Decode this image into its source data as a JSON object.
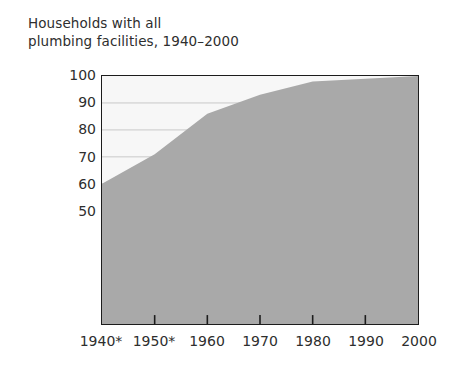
{
  "chart_data": {
    "type": "area",
    "title": "Households with all\nplumbing facilities, 1940–2000",
    "xlabel": "",
    "ylabel": "Percentage",
    "categories": [
      "1940*",
      "1950*",
      "1960",
      "1970",
      "1980",
      "1990",
      "2000"
    ],
    "x": [
      1940,
      1950,
      1960,
      1970,
      1980,
      1990,
      2000
    ],
    "values": [
      60,
      71,
      86,
      93,
      98,
      99,
      100
    ],
    "series": [
      {
        "name": "Households with all plumbing facilities",
        "values": [
          60,
          71,
          86,
          93,
          98,
          99,
          100
        ]
      }
    ],
    "ylim": [
      8,
      100
    ],
    "xlim": [
      1940,
      2000
    ],
    "y_ticks": [
      100,
      90,
      80,
      70,
      60,
      50
    ],
    "grid": true,
    "grid_axis": "y",
    "legend": "none",
    "fill_color": "#a9a9a9",
    "plot_background": "#f7f7f7",
    "grid_color": "#c9c9c9",
    "axis_color": "#1c1c1c",
    "text_color": "#2e2e2e",
    "footnote_marker": "*"
  },
  "axes": {
    "y": {
      "title": "Percentage",
      "ticks": [
        {
          "label": "100",
          "value": 100
        },
        {
          "label": "90",
          "value": 90
        },
        {
          "label": "80",
          "value": 80
        },
        {
          "label": "70",
          "value": 70
        },
        {
          "label": "60",
          "value": 60
        },
        {
          "label": "50",
          "value": 50
        }
      ]
    },
    "x": {
      "title": "",
      "ticks": [
        {
          "label": "1940*",
          "value": 1940
        },
        {
          "label": "1950*",
          "value": 1950
        },
        {
          "label": "1960",
          "value": 1960
        },
        {
          "label": "1970",
          "value": 1970
        },
        {
          "label": "1980",
          "value": 1980
        },
        {
          "label": "1990",
          "value": 1990
        },
        {
          "label": "2000",
          "value": 2000
        }
      ]
    }
  }
}
